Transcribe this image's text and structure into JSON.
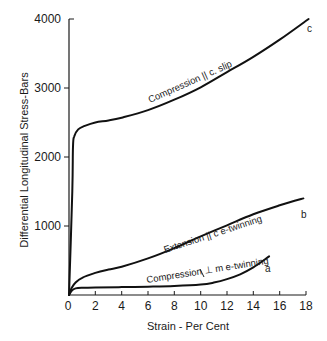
{
  "chart_data": {
    "type": "line",
    "title": "",
    "xlabel": "Strain - Per Cent",
    "ylabel": "Differential Longitudinal Stress-Bars",
    "xlim": [
      0,
      18
    ],
    "ylim": [
      0,
      4000
    ],
    "x_ticks": [
      0,
      2,
      4,
      6,
      8,
      10,
      12,
      14,
      16,
      18
    ],
    "y_ticks": [
      1000,
      2000,
      3000,
      4000
    ],
    "grid": false,
    "legend": "none (curves labeled inline)",
    "series": [
      {
        "id": "c",
        "name": "Compression || c. slip",
        "end_label": "c",
        "x": [
          0,
          0.25,
          0.3,
          0.4,
          0.7,
          1.2,
          2,
          3,
          4,
          6,
          8,
          10,
          12,
          14,
          16,
          18.2
        ],
        "y": [
          0,
          1500,
          2150,
          2300,
          2400,
          2450,
          2500,
          2530,
          2570,
          2680,
          2830,
          3010,
          3230,
          3450,
          3700,
          4000
        ]
      },
      {
        "id": "b",
        "name": "Extension || c. e-twinning",
        "end_label": "b",
        "x": [
          0,
          0.2,
          0.5,
          1,
          2,
          3,
          4,
          6,
          8,
          10,
          12,
          14,
          16,
          17.8
        ],
        "y": [
          0,
          100,
          180,
          250,
          320,
          370,
          410,
          530,
          680,
          850,
          1010,
          1170,
          1300,
          1400
        ]
      },
      {
        "id": "a",
        "name": "Compression ⊥ m e-twinning",
        "end_label": "a",
        "x": [
          0,
          0.2,
          0.5,
          1,
          2,
          4,
          6,
          8,
          10,
          11,
          12,
          13,
          14,
          15.2
        ],
        "y": [
          0,
          60,
          95,
          105,
          110,
          115,
          120,
          130,
          150,
          180,
          230,
          300,
          400,
          560
        ]
      }
    ]
  },
  "labels": {
    "x_axis_title": "Strain - Per Cent",
    "y_axis_title": "Differential Longitudinal Stress-Bars",
    "curve_c_text": "Compression  || c. slip",
    "curve_b_text": "Extension || c  e-twinning",
    "curve_a_text": "Compression ⊥ m e-twinning",
    "letter_c": "c",
    "letter_b": "b",
    "letter_a": "a",
    "x_tick_labels": [
      "0",
      "2",
      "4",
      "6",
      "8",
      "10",
      "12",
      "14",
      "16",
      "18"
    ],
    "y_tick_labels": [
      "1000",
      "2000",
      "3000",
      "4000"
    ]
  }
}
